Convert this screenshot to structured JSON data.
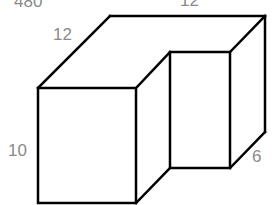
{
  "figure": {
    "type": "isometric-solid",
    "line_color": "#000000",
    "label_color": "#8a8a8a",
    "labels": {
      "answer": "480",
      "depth_left": "12",
      "width_top": "12",
      "height": "10",
      "notch_depth": "6"
    }
  }
}
